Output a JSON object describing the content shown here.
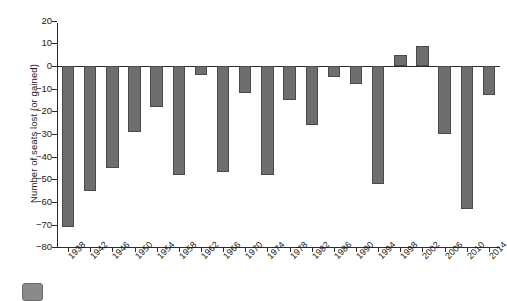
{
  "chart_data": {
    "type": "bar",
    "title": "",
    "xlabel": "",
    "ylabel": "Number of seats lost (or gained)",
    "ylim": [
      -80,
      20
    ],
    "ytick_step": 10,
    "grid": false,
    "legend": null,
    "bar_color": "#6e6e6e",
    "bar_edge_color": "#4a4a4a",
    "axis_color": "#2b2b2b",
    "categories": [
      "1938",
      "1942",
      "1946",
      "1950",
      "1954",
      "1958",
      "1962",
      "1966",
      "1970",
      "1974",
      "1978",
      "1982",
      "1986",
      "1990",
      "1994",
      "1998",
      "2002",
      "2006",
      "2010",
      "2014"
    ],
    "values": [
      -71,
      -55,
      -45,
      -29,
      -18,
      -48,
      -4,
      -47,
      -12,
      -48,
      -15,
      -26,
      -5,
      -8,
      -52,
      5,
      9,
      -30,
      -63,
      -13
    ],
    "yticks": [
      20,
      10,
      0,
      -10,
      -20,
      -30,
      -40,
      -50,
      -60,
      -70,
      -80
    ],
    "ytick_labels": [
      "20",
      "10",
      "0",
      "−10",
      "−20",
      "−30",
      "−40",
      "−50",
      "−60",
      "−70",
      "−80"
    ]
  },
  "footer": {
    "swatch_name": "footer-swatch"
  }
}
